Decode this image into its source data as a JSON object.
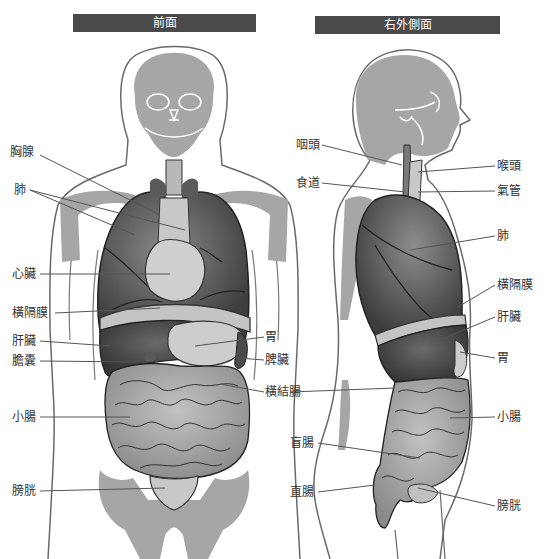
{
  "diagram": {
    "views": [
      {
        "id": "front",
        "title": "前面"
      },
      {
        "id": "side",
        "title": "右外側面"
      }
    ],
    "front_labels": [
      {
        "key": "thymus",
        "text": "胸腺",
        "x": 10,
        "y": 151
      },
      {
        "key": "lungs",
        "text": "肺",
        "x": 14,
        "y": 185
      },
      {
        "key": "heart",
        "text": "心臟",
        "x": 12,
        "y": 268
      },
      {
        "key": "diaphragm",
        "text": "橫隔膜",
        "x": 12,
        "y": 307
      },
      {
        "key": "liver",
        "text": "肝臟",
        "x": 12,
        "y": 335
      },
      {
        "key": "gallbladder",
        "text": "膽囊",
        "x": 12,
        "y": 355
      },
      {
        "key": "stomach",
        "text": "胃",
        "x": 265,
        "y": 331
      },
      {
        "key": "spleen",
        "text": "脾臟",
        "x": 265,
        "y": 354
      },
      {
        "key": "transverse_colon",
        "text": "橫結腸",
        "x": 265,
        "y": 386
      },
      {
        "key": "small_intestine",
        "text": "小腸",
        "x": 12,
        "y": 411
      },
      {
        "key": "bladder",
        "text": "膀胱",
        "x": 12,
        "y": 485
      }
    ],
    "side_labels": [
      {
        "key": "pharynx",
        "text": "咽頭",
        "x": 296,
        "y": 139
      },
      {
        "key": "esophagus",
        "text": "食道",
        "x": 296,
        "y": 177
      },
      {
        "key": "larynx",
        "text": "喉頭",
        "x": 497,
        "y": 160
      },
      {
        "key": "trachea",
        "text": "氣管",
        "x": 497,
        "y": 185
      },
      {
        "key": "lung",
        "text": "肺",
        "x": 497,
        "y": 230
      },
      {
        "key": "diaphragm",
        "text": "橫隔膜",
        "x": 497,
        "y": 279
      },
      {
        "key": "liver",
        "text": "肝臟",
        "x": 497,
        "y": 311
      },
      {
        "key": "stomach",
        "text": "胃",
        "x": 497,
        "y": 352
      },
      {
        "key": "small_intestine",
        "text": "小腸",
        "x": 497,
        "y": 411
      },
      {
        "key": "cecum",
        "text": "盲腸",
        "x": 290,
        "y": 437
      },
      {
        "key": "rectum",
        "text": "直腸",
        "x": 290,
        "y": 486
      },
      {
        "key": "bladder",
        "text": "膀胱",
        "x": 497,
        "y": 500
      }
    ]
  },
  "colors": {
    "title_bg": "#4a4a4a",
    "title_text": "#ffffff",
    "bone": "#a6a6a6",
    "organ_dark": "#4f4f4f",
    "organ_mid": "#7a7a7a",
    "organ_light": "#b5b5b5",
    "intestine": "#9c9c9c",
    "outline": "#555555",
    "leader": "#555555"
  }
}
